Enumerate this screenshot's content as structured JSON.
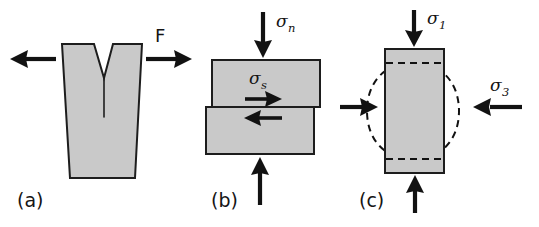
{
  "figure": {
    "background_color": "#ffffff",
    "body_fill_color": "#c9c9c9",
    "outline_color": "#1d1d1d",
    "arrow_color": "#121212"
  },
  "panels": [
    {
      "id": "a",
      "label": "(a)",
      "description": "Notched specimen pulled apart by opposing horizontal forces",
      "labels": [
        {
          "name": "force-label",
          "text": "F",
          "symbol": "F",
          "subscript": ""
        }
      ],
      "arrows": [
        {
          "name": "tension-arrow-left",
          "direction": "left"
        },
        {
          "name": "tension-arrow-right",
          "direction": "right"
        }
      ]
    },
    {
      "id": "b",
      "label": "(b)",
      "description": "Two blocks sheared past one another under normal stress",
      "labels": [
        {
          "name": "normal-stress-label",
          "text": "σn",
          "symbol": "σ",
          "subscript": "n"
        },
        {
          "name": "shear-stress-label",
          "text": "σs",
          "symbol": "σ",
          "subscript": "s"
        }
      ],
      "arrows": [
        {
          "name": "normal-stress-arrow-top",
          "direction": "down"
        },
        {
          "name": "normal-stress-arrow-bottom",
          "direction": "up"
        },
        {
          "name": "shear-arrow-upper-block",
          "direction": "right"
        },
        {
          "name": "shear-arrow-lower-block",
          "direction": "left"
        }
      ]
    },
    {
      "id": "c",
      "label": "(c)",
      "description": "Cylindrical sample under triaxial compression, barrelling shown dashed",
      "labels": [
        {
          "name": "axial-stress-label",
          "text": "σ1",
          "symbol": "σ",
          "subscript": "1"
        },
        {
          "name": "confining-stress-label",
          "text": "σ3",
          "symbol": "σ",
          "subscript": "3"
        }
      ],
      "arrows": [
        {
          "name": "axial-stress-arrow-top",
          "direction": "down"
        },
        {
          "name": "axial-stress-arrow-bottom",
          "direction": "up"
        },
        {
          "name": "confining-stress-arrow-left",
          "direction": "right"
        },
        {
          "name": "confining-stress-arrow-right",
          "direction": "left"
        }
      ]
    }
  ]
}
